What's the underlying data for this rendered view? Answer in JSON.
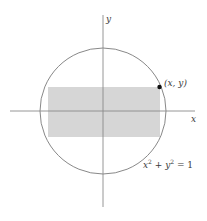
{
  "diagram": {
    "axes": {
      "x_label": "x",
      "y_label": "y",
      "color": "#8a8a8a"
    },
    "circle": {
      "equation_parts": [
        "x",
        "2",
        " + ",
        "y",
        "2",
        " = 1"
      ],
      "equation": "x² + y² = 1",
      "color": "#7a7a7a"
    },
    "rectangle": {
      "fill": "#d4d4d4",
      "description": "inscribed rectangle with corner on circle"
    },
    "point": {
      "label": "(x, y)",
      "color": "#111111"
    }
  }
}
